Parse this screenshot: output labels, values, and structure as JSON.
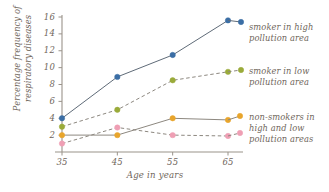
{
  "chart_data": {
    "type": "line",
    "title": "",
    "subtitle": "",
    "xlabel": "Age in years",
    "ylabel": "Percentage frequency of respiratory diseases",
    "x": [
      35,
      45,
      55,
      65
    ],
    "xticklabels": [
      "35",
      "45",
      "55",
      "65"
    ],
    "yticklabels": [
      "2",
      "4",
      "6",
      "8",
      "10",
      "12",
      "14",
      "16"
    ],
    "yticks": [
      2,
      4,
      6,
      8,
      10,
      12,
      14,
      16
    ],
    "xlim": [
      30,
      70
    ],
    "ylim": [
      0,
      16
    ],
    "grid": false,
    "legend_position": "right",
    "series": [
      {
        "name": "smoker in high pollution area",
        "values": [
          4.0,
          8.9,
          11.5,
          15.6
        ],
        "color": "#3b6ea5",
        "linestyle": "solid",
        "marker": "circle"
      },
      {
        "name": "smoker in low pollution area",
        "values": [
          3.0,
          5.0,
          8.5,
          9.5
        ],
        "color": "#9aab3a",
        "linestyle": "dashed",
        "marker": "circle"
      },
      {
        "name": "non-smokers in high pollution area",
        "values": [
          2.0,
          2.0,
          4.0,
          3.8
        ],
        "color": "#e8a52c",
        "linestyle": "solid",
        "marker": "circle"
      },
      {
        "name": "non-smokers in low pollution area",
        "values": [
          1.0,
          2.9,
          2.0,
          1.9
        ],
        "color": "#ef9fb4",
        "linestyle": "dashed",
        "marker": "circle"
      }
    ],
    "legend_entries": [
      "smoker in high\npollution area",
      "smoker in low\npollution area",
      "non-smokers in\nhigh and low\npollution areas"
    ]
  },
  "axis": {
    "line_color": "#9a938a",
    "text_color": "#6f665b"
  }
}
